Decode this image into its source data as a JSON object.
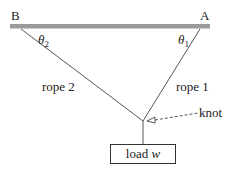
{
  "labels": {
    "point_b": "B",
    "point_a": "A",
    "theta2_symbol": "θ",
    "theta2_sub": "2",
    "theta1_symbol": "θ",
    "theta1_sub": "1",
    "rope2": "rope 2",
    "rope1": "rope 1",
    "knot": "knot",
    "load_text": "load ",
    "load_var": "w"
  },
  "colors": {
    "ceiling": "#9a9a9a",
    "rope": "#555555"
  }
}
